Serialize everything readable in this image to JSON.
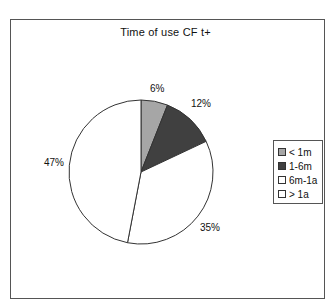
{
  "chart_data": {
    "type": "pie",
    "title": "Time of use CF t+",
    "categories": [
      "< 1m",
      "1-6m",
      "6m-1a",
      "> 1a"
    ],
    "values": [
      6,
      12,
      35,
      47
    ],
    "value_labels": [
      "6%",
      "12%",
      "35%",
      "47%"
    ],
    "colors": [
      "#a6a6a6",
      "#404040",
      "#ffffff",
      "#ffffff"
    ],
    "start_angle": "12 o'clock, clockwise",
    "legend_position": "right"
  },
  "labels": {
    "s0": "6%",
    "s1": "12%",
    "s2": "35%",
    "s3": "47%"
  },
  "legend": {
    "items": [
      {
        "label": "< 1m",
        "color": "#a6a6a6"
      },
      {
        "label": "1-6m",
        "color": "#404040"
      },
      {
        "label": "6m-1a",
        "color": "#ffffff"
      },
      {
        "label": "> 1a",
        "color": "#ffffff"
      }
    ]
  }
}
